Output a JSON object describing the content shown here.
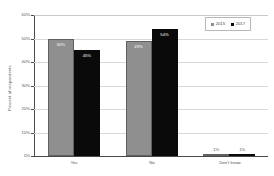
{
  "chart_data": {
    "type": "bar",
    "title": "",
    "subtitle": "",
    "xlabel": "",
    "ylabel": "Percent of respondents",
    "categories": [
      "Yes",
      "No",
      "Don't know"
    ],
    "series": [
      {
        "name": "2015",
        "color": "#8f8f8f",
        "values": [
          50,
          49,
          1
        ],
        "labels": [
          "50%",
          "49%",
          "1%"
        ]
      },
      {
        "name": "2017",
        "color": "#0a0a0a",
        "values": [
          45,
          54,
          1
        ],
        "labels": [
          "45%",
          "54%",
          "1%"
        ]
      }
    ],
    "ylim": [
      0,
      60
    ],
    "yticks": [
      0,
      10,
      20,
      30,
      40,
      50,
      60
    ],
    "ytick_labels": [
      "0%",
      "10%",
      "20%",
      "30%",
      "40%",
      "50%",
      "60%"
    ],
    "grid": true,
    "grid_axis": "y",
    "legend_position": "top-right",
    "legend_entries": [
      "2015",
      "2017"
    ]
  },
  "colors": {
    "series_2015": "#8f8f8f",
    "series_2017": "#0a0a0a",
    "gridline": "#d8d8d8",
    "axis": "#4a4a4a",
    "text": "#555555",
    "background": "#ffffff"
  }
}
